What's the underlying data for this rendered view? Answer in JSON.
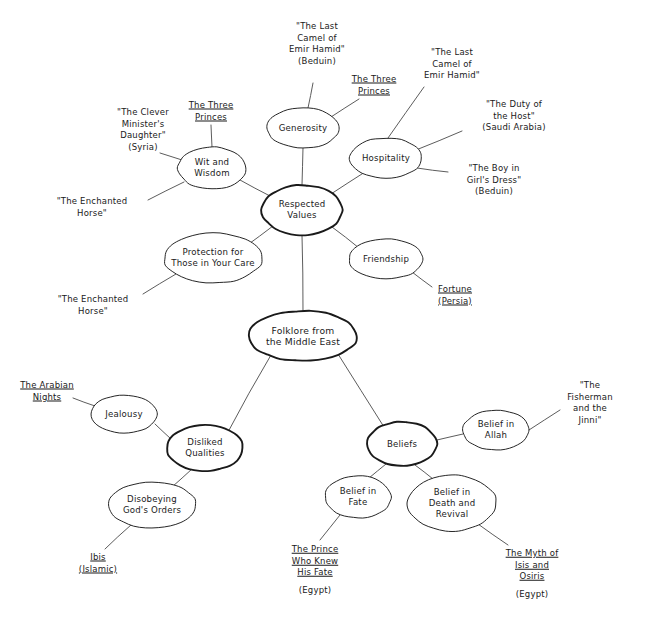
{
  "diagram": {
    "type": "mind-map",
    "title": "Folklore from the Middle East",
    "root": {
      "id": "root",
      "label": "Folklore from\nthe Middle East",
      "cx": 303,
      "cy": 336,
      "rx": 54,
      "ry": 25,
      "emphasis": "strong"
    },
    "branches": [
      {
        "id": "respected-values",
        "label": "Respected\nValues",
        "cx": 302,
        "cy": 210,
        "rx": 40,
        "ry": 25,
        "emphasis": "strong",
        "children": [
          {
            "id": "generosity",
            "label": "Generosity",
            "cx": 303,
            "cy": 128,
            "rx": 36,
            "ry": 20,
            "sources": [
              {
                "id": "last-camel-bedouin",
                "text": "\"The Last\nCamel of\nEmir Hamid\"\n(Beduin)",
                "x": 317,
                "y": 44,
                "align": "center",
                "underline": false
              },
              {
                "id": "three-princes-gen",
                "text": "The Three\nPrinces",
                "x": 374,
                "y": 85,
                "align": "center",
                "underline": true
              }
            ]
          },
          {
            "id": "hospitality",
            "label": "Hospitality",
            "cx": 386,
            "cy": 158,
            "rx": 36,
            "ry": 20,
            "sources": [
              {
                "id": "last-camel",
                "text": "\"The Last\nCamel of\nEmir Hamid\"",
                "x": 452,
                "y": 64,
                "align": "center",
                "underline": false
              },
              {
                "id": "duty-of-host",
                "text": "\"The Duty of\nthe Host\"\n(Saudi Arabia)",
                "x": 514,
                "y": 116,
                "align": "center",
                "underline": false
              },
              {
                "id": "boy-in-girls-dress",
                "text": "\"The Boy in\nGirl's Dress\"\n(Beduin)",
                "x": 494,
                "y": 180,
                "align": "center",
                "underline": false
              }
            ]
          },
          {
            "id": "wit-and-wisdom",
            "label": "Wit and\nWisdom",
            "cx": 212,
            "cy": 168,
            "rx": 34,
            "ry": 21,
            "sources": [
              {
                "id": "three-princes-wit",
                "text": "The Three\nPrinces",
                "x": 211,
                "y": 111,
                "align": "center",
                "underline": true
              },
              {
                "id": "clever-ministers-daughter",
                "text": "\"The Clever\nMinister's\nDaughter\"\n(Syria)",
                "x": 143,
                "y": 130,
                "align": "center",
                "underline": false
              },
              {
                "id": "enchanted-horse-wit",
                "text": "\"The Enchanted\nHorse\"",
                "x": 92,
                "y": 207,
                "align": "center",
                "underline": false
              }
            ]
          },
          {
            "id": "protection",
            "label": "Protection for\nThose in Your Care",
            "cx": 213,
            "cy": 258,
            "rx": 49,
            "ry": 25,
            "sources": [
              {
                "id": "enchanted-horse-prot",
                "text": "\"The Enchanted\nHorse\"",
                "x": 93,
                "y": 305,
                "align": "center",
                "underline": false
              }
            ]
          },
          {
            "id": "friendship",
            "label": "Friendship",
            "cx": 386,
            "cy": 259,
            "rx": 37,
            "ry": 20,
            "sources": [
              {
                "id": "fortune-persia",
                "text": "Fortune\n(Persia)",
                "x": 455,
                "y": 295,
                "align": "center",
                "underline": true
              }
            ]
          }
        ]
      },
      {
        "id": "disliked-qualities",
        "label": "Disliked\nQualities",
        "cx": 205,
        "cy": 448,
        "rx": 38,
        "ry": 23,
        "emphasis": "strong",
        "children": [
          {
            "id": "jealousy",
            "label": "Jealousy",
            "cx": 124,
            "cy": 414,
            "rx": 33,
            "ry": 19,
            "sources": [
              {
                "id": "arabian-nights",
                "text": "The Arabian\nNights",
                "x": 47,
                "y": 391,
                "align": "center",
                "underline": true
              }
            ]
          },
          {
            "id": "disobeying-gods-orders",
            "label": "Disobeying\nGod's Orders",
            "cx": 152,
            "cy": 505,
            "rx": 44,
            "ry": 23,
            "sources": [
              {
                "id": "ibis-islamic",
                "text": "Ibis\n(Islamic)",
                "x": 98,
                "y": 563,
                "align": "center",
                "underline": true
              }
            ]
          }
        ]
      },
      {
        "id": "beliefs",
        "label": "Beliefs",
        "cx": 402,
        "cy": 444,
        "rx": 35,
        "ry": 22,
        "emphasis": "strong",
        "children": [
          {
            "id": "belief-in-allah",
            "label": "Belief in\nAllah",
            "cx": 496,
            "cy": 430,
            "rx": 33,
            "ry": 20,
            "sources": [
              {
                "id": "fisherman-and-jinni",
                "text": "\"The Fisherman\nand the\nJinni\"",
                "x": 590,
                "y": 403,
                "align": "center",
                "underline": false
              }
            ]
          },
          {
            "id": "belief-in-fate",
            "label": "Belief in\nFate",
            "cx": 358,
            "cy": 497,
            "rx": 33,
            "ry": 21,
            "sources": [
              {
                "id": "prince-who-knew-his-fate",
                "text": "The Prince\nWho Knew\nHis Fate",
                "x": 315,
                "y": 561,
                "align": "center",
                "underline": true
              },
              {
                "id": "prince-egypt",
                "text": "(Egypt)",
                "x": 315,
                "y": 591,
                "align": "center",
                "underline": false
              }
            ]
          },
          {
            "id": "belief-in-death-and-revival",
            "label": "Belief in\nDeath and\nRevival",
            "cx": 452,
            "cy": 503,
            "rx": 44,
            "ry": 28,
            "sources": [
              {
                "id": "myth-of-isis-and-osiris",
                "text": "The Myth of\nIsis and\nOsiris",
                "x": 532,
                "y": 565,
                "align": "center",
                "underline": true
              },
              {
                "id": "isis-egypt",
                "text": "(Egypt)",
                "x": 532,
                "y": 595,
                "align": "center",
                "underline": false
              }
            ]
          }
        ]
      }
    ],
    "edges": [
      {
        "id": "edge-root-respected",
        "from": "root",
        "to": "respected-values",
        "x1": 303,
        "y1": 311,
        "x2": 302,
        "y2": 235
      },
      {
        "id": "edge-root-disliked",
        "from": "root",
        "to": "disliked-qualities",
        "x1": 271,
        "y1": 355,
        "x2": 228,
        "y2": 432
      },
      {
        "id": "edge-root-beliefs",
        "from": "root",
        "to": "beliefs",
        "x1": 338,
        "y1": 354,
        "x2": 384,
        "y2": 427
      },
      {
        "id": "edge-rv-generosity",
        "from": "respected-values",
        "to": "generosity",
        "x1": 302,
        "y1": 185,
        "x2": 303,
        "y2": 148
      },
      {
        "id": "edge-rv-hospitality",
        "from": "respected-values",
        "to": "hospitality",
        "x1": 331,
        "y1": 194,
        "x2": 365,
        "y2": 172
      },
      {
        "id": "edge-rv-wit",
        "from": "respected-values",
        "to": "wit-and-wisdom",
        "x1": 270,
        "y1": 196,
        "x2": 240,
        "y2": 180
      },
      {
        "id": "edge-rv-protection",
        "from": "respected-values",
        "to": "protection",
        "x1": 273,
        "y1": 226,
        "x2": 246,
        "y2": 246
      },
      {
        "id": "edge-rv-friendship",
        "from": "respected-values",
        "to": "friendship",
        "x1": 332,
        "y1": 227,
        "x2": 359,
        "y2": 248
      },
      {
        "id": "edge-gen-lastcamel",
        "from": "generosity",
        "to": "last-camel-bedouin",
        "x1": 308,
        "y1": 108,
        "x2": 313,
        "y2": 83
      },
      {
        "id": "edge-gen-threeprinces",
        "from": "generosity",
        "to": "three-princes-gen",
        "x1": 331,
        "y1": 117,
        "x2": 359,
        "y2": 99
      },
      {
        "id": "edge-hosp-lastcamel",
        "from": "hospitality",
        "to": "last-camel",
        "x1": 388,
        "y1": 138,
        "x2": 424,
        "y2": 87
      },
      {
        "id": "edge-hosp-duty",
        "from": "hospitality",
        "to": "duty-of-host",
        "x1": 416,
        "y1": 150,
        "x2": 462,
        "y2": 131
      },
      {
        "id": "edge-hosp-boy",
        "from": "hospitality",
        "to": "boy-in-girls-dress",
        "x1": 417,
        "y1": 168,
        "x2": 448,
        "y2": 172
      },
      {
        "id": "edge-wit-threeprinces",
        "from": "wit-and-wisdom",
        "to": "three-princes-wit",
        "x1": 212,
        "y1": 147,
        "x2": 211,
        "y2": 125
      },
      {
        "id": "edge-wit-clever",
        "from": "wit-and-wisdom",
        "to": "clever-ministers-daughter",
        "x1": 182,
        "y1": 160,
        "x2": 160,
        "y2": 153
      },
      {
        "id": "edge-wit-horse",
        "from": "wit-and-wisdom",
        "to": "enchanted-horse-wit",
        "x1": 184,
        "y1": 182,
        "x2": 148,
        "y2": 200
      },
      {
        "id": "edge-prot-horse",
        "from": "protection",
        "to": "enchanted-horse-prot",
        "x1": 176,
        "y1": 274,
        "x2": 143,
        "y2": 294
      },
      {
        "id": "edge-friend-fortune",
        "from": "friendship",
        "to": "fortune-persia",
        "x1": 412,
        "y1": 272,
        "x2": 432,
        "y2": 287
      },
      {
        "id": "edge-dq-jealousy",
        "from": "disliked-qualities",
        "to": "jealousy",
        "x1": 171,
        "y1": 439,
        "x2": 155,
        "y2": 424
      },
      {
        "id": "edge-dq-disobeying",
        "from": "disliked-qualities",
        "to": "disobeying-gods-orders",
        "x1": 192,
        "y1": 469,
        "x2": 172,
        "y2": 487
      },
      {
        "id": "edge-jeal-arabian",
        "from": "jealousy",
        "to": "arabian-nights",
        "x1": 95,
        "y1": 406,
        "x2": 73,
        "y2": 398
      },
      {
        "id": "edge-disob-ibis",
        "from": "disobeying-gods-orders",
        "to": "ibis-islamic",
        "x1": 131,
        "y1": 525,
        "x2": 105,
        "y2": 549
      },
      {
        "id": "edge-bel-allah",
        "from": "beliefs",
        "to": "belief-in-allah",
        "x1": 437,
        "y1": 440,
        "x2": 463,
        "y2": 434
      },
      {
        "id": "edge-bel-fate",
        "from": "beliefs",
        "to": "belief-in-fate",
        "x1": 386,
        "y1": 464,
        "x2": 369,
        "y2": 478
      },
      {
        "id": "edge-bel-death",
        "from": "beliefs",
        "to": "belief-in-death-and-revival",
        "x1": 415,
        "y1": 465,
        "x2": 433,
        "y2": 479
      },
      {
        "id": "edge-allah-fisherman",
        "from": "belief-in-allah",
        "to": "fisherman-and-jinni",
        "x1": 529,
        "y1": 430,
        "x2": 560,
        "y2": 410
      },
      {
        "id": "edge-fate-prince",
        "from": "belief-in-fate",
        "to": "prince-who-knew-his-fate",
        "x1": 340,
        "y1": 515,
        "x2": 320,
        "y2": 540
      },
      {
        "id": "edge-death-myth",
        "from": "belief-in-death-and-revival",
        "to": "myth-of-isis-and-osiris",
        "x1": 478,
        "y1": 524,
        "x2": 508,
        "y2": 545
      }
    ],
    "colors": {
      "ink": "#1a1a1a",
      "line": "#4a4a4a",
      "background": "#ffffff"
    }
  }
}
